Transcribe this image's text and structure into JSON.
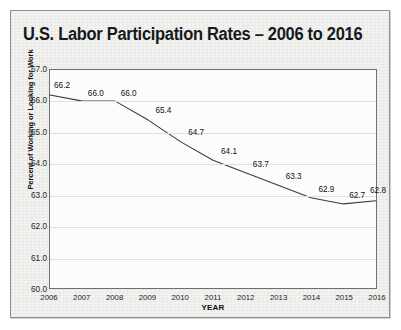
{
  "figure": {
    "title": "U.S. Labor Participation Rates – 2006 to 2016",
    "border_color": "#8d8d8d",
    "card_background": "#f2f2f0",
    "plot_background": "#fcfcfc",
    "line_color": "#3a3a3a",
    "grid_color": "#dfdfdf"
  },
  "chart_data": {
    "type": "line",
    "title": "U.S. Labor Participation Rates – 2006 to 2016",
    "xlabel": "YEAR",
    "ylabel": "Percent of Working or Looking for Work",
    "categories": [
      "2006",
      "2007",
      "2008",
      "2009",
      "2010",
      "2011",
      "2012",
      "2013",
      "2014",
      "2015",
      "2016"
    ],
    "values": [
      66.2,
      66.0,
      66.0,
      65.4,
      64.7,
      64.1,
      63.7,
      63.3,
      62.9,
      62.7,
      62.8
    ],
    "point_labels": [
      "66.2",
      "66.0",
      "66.0",
      "65.4",
      "64.7",
      "64.1",
      "63.7",
      "63.3",
      "62.9",
      "62.7",
      "62.8"
    ],
    "ylim": [
      60.0,
      67.0
    ],
    "ytick_labels": [
      "67.0",
      "66.0",
      "65.0",
      "64.0",
      "63.0",
      "62.0",
      "61.0",
      "60.0"
    ],
    "ytick_values": [
      67.0,
      66.0,
      65.0,
      64.0,
      63.0,
      62.0,
      61.0,
      60.0
    ],
    "grid": "horizontal",
    "legend": "none",
    "markers": "none"
  }
}
